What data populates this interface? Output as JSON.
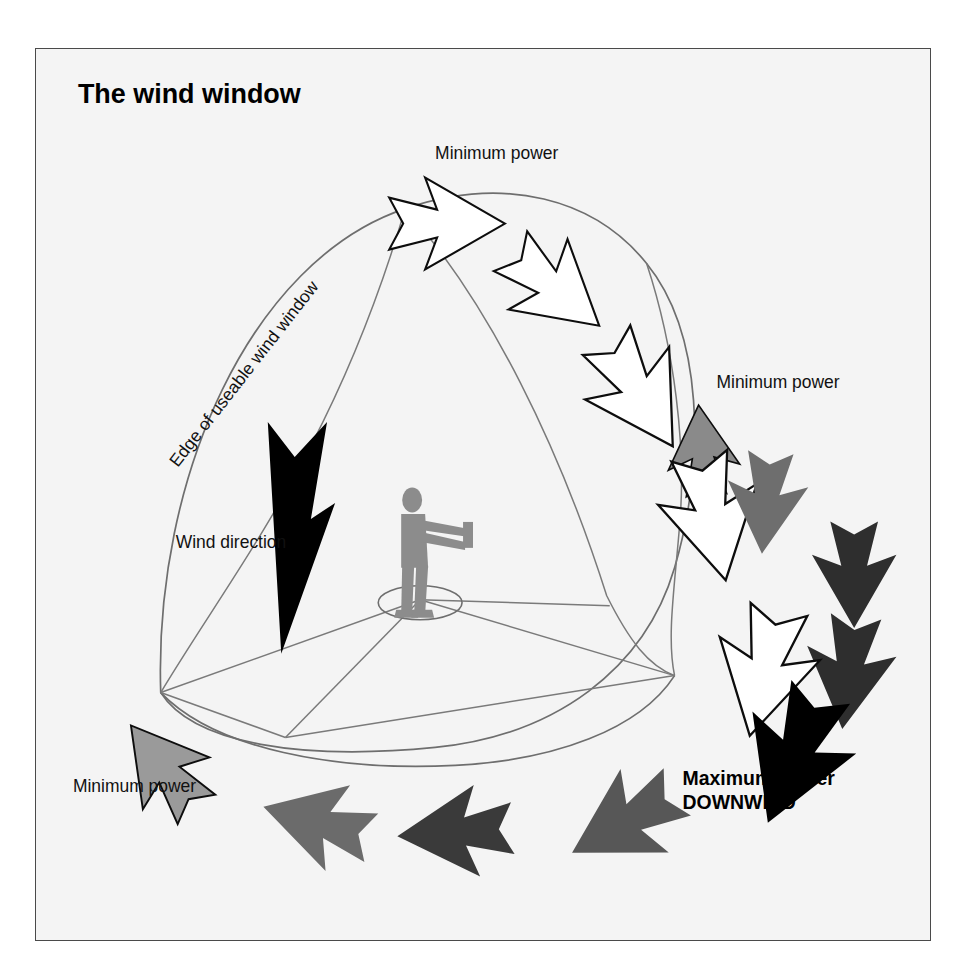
{
  "figure": {
    "title": "The wind window",
    "background_color": "#f4f4f4",
    "frame_border_color": "#4a4a4a",
    "line_color": "#6e6e6e",
    "figure_color": "#8c8c8c"
  },
  "labels": {
    "title": "The wind window",
    "edge_label": "Edge of useable wind window",
    "wind_direction": "Wind direction",
    "min_power_top": "Minimum power",
    "min_power_right": "Minimum power",
    "min_power_bottom_left": "Minimum power",
    "max_power_line1": "Maximum power",
    "max_power_line2": "DOWNWIND"
  },
  "chart_data": {
    "type": "diagram",
    "title": "The wind window",
    "legend_position": "inline annotations",
    "power_scale": [
      {
        "zone": "edge of window",
        "power": "minimum",
        "arrow_fill": "#ffffff"
      },
      {
        "zone": "upper intermediate",
        "power": "low",
        "arrow_fill": "#ffffff"
      },
      {
        "zone": "side intermediate",
        "power": "medium",
        "arrow_fill": "#8a8a8a"
      },
      {
        "zone": "lower intermediate",
        "power": "high",
        "arrow_fill": "#3a3a3a"
      },
      {
        "zone": "downwind centre",
        "power": "maximum",
        "arrow_fill": "#000000"
      }
    ],
    "arrows": [
      {
        "id": "a1",
        "fill": "#ffffff",
        "power": "minimum",
        "x": 412,
        "y": 175,
        "rot": 0,
        "scale": 1.0
      },
      {
        "id": "a2",
        "fill": "#ffffff",
        "power": "minimum",
        "x": 520,
        "y": 240,
        "rot": 40,
        "scale": 1.0
      },
      {
        "id": "a3",
        "fill": "#ffffff",
        "power": "low",
        "x": 605,
        "y": 345,
        "rot": 58,
        "scale": 1.08
      },
      {
        "id": "a4",
        "fill": "#8a8a8a",
        "power": "medium",
        "x": 668,
        "y": 402,
        "rot": -95,
        "scale": 0.78
      },
      {
        "id": "a5",
        "fill": "#ffffff",
        "power": "low",
        "x": 678,
        "y": 470,
        "rot": 78,
        "scale": 1.1
      },
      {
        "id": "a6",
        "fill": "#6e6e6e",
        "power": "medium",
        "x": 732,
        "y": 455,
        "rot": 95,
        "scale": 0.88
      },
      {
        "id": "a7",
        "fill": "#2e2e2e",
        "power": "high",
        "x": 820,
        "y": 527,
        "rot": 90,
        "scale": 0.92
      },
      {
        "id": "a8",
        "fill": "#2e2e2e",
        "power": "high",
        "x": 815,
        "y": 625,
        "rot": 97,
        "scale": 0.98
      },
      {
        "id": "a9",
        "fill": "#ffffff",
        "power": "low",
        "x": 730,
        "y": 625,
        "rot": 103,
        "scale": 1.12
      },
      {
        "id": "a10",
        "fill": "#000000",
        "power": "maximum",
        "x": 760,
        "y": 710,
        "rot": 112,
        "scale": 1.22
      },
      {
        "id": "a11",
        "fill": "#575757",
        "power": "high",
        "x": 590,
        "y": 775,
        "rot": 150,
        "scale": 1.05
      },
      {
        "id": "a12",
        "fill": "#3a3a3a",
        "power": "high",
        "x": 420,
        "y": 785,
        "rot": 176,
        "scale": 1.0
      },
      {
        "id": "a13",
        "fill": "#6b6b6b",
        "power": "medium",
        "x": 282,
        "y": 775,
        "rot": 196,
        "scale": 0.97
      },
      {
        "id": "a14",
        "fill": "#9a9a9a",
        "power": "minimum",
        "x": 128,
        "y": 720,
        "rot": 232,
        "scale": 0.92
      },
      {
        "id": "a15",
        "fill": "#000000",
        "power": "wind",
        "x": 262,
        "y": 490,
        "rot": 90,
        "scale": 1.35
      }
    ]
  }
}
